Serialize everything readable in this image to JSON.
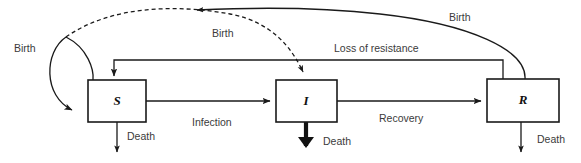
{
  "diagram": {
    "background_color": "#ffffff",
    "line_color": "#1a1a1a",
    "text_color": "#3b3b3b",
    "compartments": [
      {
        "id": "S",
        "label": "S",
        "name": "susceptible"
      },
      {
        "id": "I",
        "label": "I",
        "name": "infected"
      },
      {
        "id": "R",
        "label": "R",
        "name": "recovered"
      }
    ],
    "flows": [
      {
        "id": "birth-s-loop",
        "label": "Birth",
        "style": "solid",
        "from": "S",
        "to": "S"
      },
      {
        "id": "birth-dashed",
        "label": "Birth",
        "style": "dashed",
        "from": "S",
        "to": "I"
      },
      {
        "id": "birth-r",
        "label": "Birth",
        "style": "solid",
        "from": "R",
        "to": "S"
      },
      {
        "id": "loss-of-resistance",
        "label": "Loss of resistance",
        "style": "solid",
        "from": "R",
        "to": "S"
      },
      {
        "id": "infection",
        "label": "Infection",
        "style": "solid",
        "from": "S",
        "to": "I"
      },
      {
        "id": "recovery",
        "label": "Recovery",
        "style": "solid",
        "from": "I",
        "to": "R"
      },
      {
        "id": "death-s",
        "label": "Death",
        "style": "solid",
        "from": "S",
        "to": "out"
      },
      {
        "id": "death-i",
        "label": "Death",
        "style": "bold",
        "from": "I",
        "to": "out"
      },
      {
        "id": "death-r",
        "label": "Death",
        "style": "solid",
        "from": "R",
        "to": "out"
      }
    ],
    "labels": {
      "birth_left": "Birth",
      "birth_dashed": "Birth",
      "birth_right": "Birth",
      "loss_of_resistance": "Loss of resistance",
      "infection": "Infection",
      "recovery": "Recovery",
      "death_s": "Death",
      "death_i": "Death",
      "death_r": "Death"
    }
  }
}
